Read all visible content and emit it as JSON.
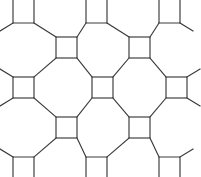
{
  "figure": {
    "name": "truncated-square-tiling",
    "vertex_configuration": "4.8.8",
    "width": 201,
    "height": 177,
    "background_color": "#ffffff",
    "stroke_color": "#3a3a3a",
    "stroke_width": 1.15
  },
  "chart_data": {
    "type": "diagram",
    "lattice": {
      "square_side": 21,
      "column_centers_x": [
        23.5,
        66.5,
        102.5,
        139.5,
        176.5
      ],
      "row_centers_y": [
        13,
        47.5,
        87.5,
        127.5,
        167
      ],
      "horizontal_pitch": 73,
      "vertical_pitch": 40,
      "stagger": "alternating rows offset by half pitch"
    },
    "squares": [
      {
        "id": "sq-r0-c0",
        "x": 13,
        "y": 2,
        "size": 21,
        "clipped": "top"
      },
      {
        "id": "sq-r0-c1",
        "x": 86,
        "y": 2,
        "size": 21,
        "clipped": "top"
      },
      {
        "id": "sq-r0-c2",
        "x": 159,
        "y": 2,
        "size": 21,
        "clipped": "top"
      },
      {
        "id": "sq-r1-c0",
        "x": 56,
        "y": 37,
        "size": 21,
        "clipped": "none"
      },
      {
        "id": "sq-r1-c1",
        "x": 129,
        "y": 37,
        "size": 21,
        "clipped": "none"
      },
      {
        "id": "sq-r2-c0",
        "x": 13,
        "y": 77,
        "size": 21,
        "clipped": "none"
      },
      {
        "id": "sq-r2-c1",
        "x": 92,
        "y": 77,
        "size": 21,
        "clipped": "none"
      },
      {
        "id": "sq-r2-c2",
        "x": 166,
        "y": 77,
        "size": 21,
        "clipped": "none"
      },
      {
        "id": "sq-r3-c0",
        "x": 56,
        "y": 117,
        "size": 21,
        "clipped": "none"
      },
      {
        "id": "sq-r3-c1",
        "x": 129,
        "y": 117,
        "size": 21,
        "clipped": "none"
      },
      {
        "id": "sq-r4-c0",
        "x": 13,
        "y": 157,
        "size": 21,
        "clipped": "bottom"
      },
      {
        "id": "sq-r4-c1",
        "x": 86,
        "y": 157,
        "size": 21,
        "clipped": "bottom"
      },
      {
        "id": "sq-r4-c2",
        "x": 159,
        "y": 157,
        "size": 21,
        "clipped": "bottom"
      }
    ],
    "octagon_count_visible": 8,
    "legend": [],
    "xlabel": "",
    "ylabel": ""
  }
}
